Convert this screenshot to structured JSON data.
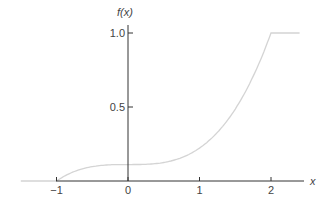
{
  "chart_data": {
    "type": "line",
    "title": "",
    "xlabel": "x",
    "ylabel": "f(x)",
    "xlim": [
      -1.5,
      2.5
    ],
    "ylim": [
      0,
      1.0
    ],
    "x_ticks": [
      -1,
      0,
      1,
      2
    ],
    "x_tick_labels": [
      "−1",
      "0",
      "1",
      "2"
    ],
    "y_ticks": [
      0.5,
      1.0
    ],
    "y_tick_labels": [
      "0.5",
      "1.0"
    ],
    "grid": false,
    "legend": null,
    "series": [
      {
        "name": "f(x)",
        "description": "piecewise CDF: 0 for x<-1, (x^3+1)/9 for -1<=x<=2, 1 for x>2",
        "color": "#d4d4d4",
        "x": [
          -1.5,
          -1.0,
          -0.75,
          -0.5,
          -0.25,
          0.0,
          0.25,
          0.5,
          0.75,
          1.0,
          1.25,
          1.5,
          1.75,
          2.0,
          2.5
        ],
        "y": [
          0.0,
          0.0,
          0.064,
          0.097,
          0.109,
          0.111,
          0.113,
          0.125,
          0.158,
          0.222,
          0.328,
          0.486,
          0.707,
          1.0,
          1.0
        ]
      }
    ]
  },
  "axis_color": "#333333"
}
